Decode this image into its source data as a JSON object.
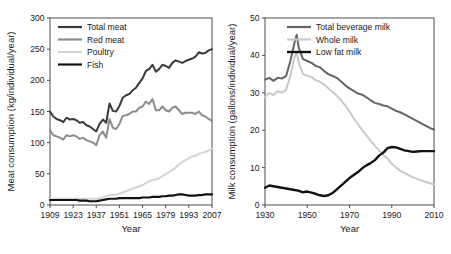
{
  "figure": {
    "background_color": "#ffffff",
    "frame_color": "#4d4d4d"
  },
  "chart_data": [
    {
      "id": "meat",
      "type": "line",
      "title": "",
      "xlabel": "Year",
      "ylabel": "Meat consumption (kg/individual/year)",
      "xlim": [
        1909,
        2007
      ],
      "ylim": [
        0,
        300
      ],
      "xticks": [
        1909,
        1923,
        1937,
        1951,
        1965,
        1979,
        1993,
        2007
      ],
      "yticks": [
        0,
        50,
        100,
        150,
        200,
        250,
        300
      ],
      "grid": false,
      "legend_position": "top-left",
      "series": [
        {
          "name": "Total meat",
          "color": "#3a3a3a",
          "width": 2.0,
          "x": [
            1909,
            1911,
            1913,
            1915,
            1917,
            1919,
            1921,
            1923,
            1925,
            1927,
            1929,
            1931,
            1933,
            1935,
            1937,
            1939,
            1941,
            1943,
            1945,
            1947,
            1949,
            1951,
            1953,
            1955,
            1957,
            1959,
            1961,
            1963,
            1965,
            1967,
            1969,
            1971,
            1973,
            1975,
            1977,
            1979,
            1981,
            1983,
            1985,
            1987,
            1989,
            1991,
            1993,
            1995,
            1997,
            1999,
            2001,
            2003,
            2005,
            2007
          ],
          "values": [
            150,
            142,
            138,
            136,
            133,
            140,
            137,
            138,
            136,
            132,
            133,
            128,
            126,
            122,
            118,
            130,
            137,
            132,
            163,
            151,
            150,
            159,
            172,
            176,
            178,
            184,
            188,
            196,
            203,
            215,
            218,
            225,
            214,
            218,
            225,
            223,
            220,
            228,
            232,
            230,
            228,
            231,
            233,
            235,
            238,
            245,
            243,
            244,
            248,
            250
          ]
        },
        {
          "name": "Red meat",
          "color": "#8c8c8c",
          "width": 2.0,
          "x": [
            1909,
            1911,
            1913,
            1915,
            1917,
            1919,
            1921,
            1923,
            1925,
            1927,
            1929,
            1931,
            1933,
            1935,
            1937,
            1939,
            1941,
            1943,
            1945,
            1947,
            1949,
            1951,
            1953,
            1955,
            1957,
            1959,
            1961,
            1963,
            1965,
            1967,
            1969,
            1971,
            1973,
            1975,
            1977,
            1979,
            1981,
            1983,
            1985,
            1987,
            1989,
            1991,
            1993,
            1995,
            1997,
            1999,
            2001,
            2003,
            2005,
            2007
          ],
          "values": [
            120,
            112,
            110,
            108,
            105,
            112,
            110,
            112,
            110,
            106,
            108,
            104,
            102,
            100,
            96,
            112,
            118,
            108,
            138,
            124,
            122,
            130,
            143,
            144,
            146,
            150,
            150,
            156,
            158,
            166,
            162,
            170,
            152,
            152,
            158,
            152,
            150,
            156,
            158,
            152,
            146,
            148,
            148,
            148,
            146,
            150,
            144,
            142,
            138,
            135
          ]
        },
        {
          "name": "Poultry",
          "color": "#d4d4d4",
          "width": 2.0,
          "x": [
            1909,
            1911,
            1913,
            1915,
            1917,
            1919,
            1921,
            1923,
            1925,
            1927,
            1929,
            1931,
            1933,
            1935,
            1937,
            1939,
            1941,
            1943,
            1945,
            1947,
            1949,
            1951,
            1953,
            1955,
            1957,
            1959,
            1961,
            1963,
            1965,
            1967,
            1969,
            1971,
            1973,
            1975,
            1977,
            1979,
            1981,
            1983,
            1985,
            1987,
            1989,
            1991,
            1993,
            1995,
            1997,
            1999,
            2001,
            2003,
            2005,
            2007
          ],
          "values": [
            10,
            10,
            10,
            10,
            10,
            10,
            10,
            10,
            10,
            10,
            10,
            10,
            10,
            10,
            10,
            11,
            12,
            14,
            16,
            16,
            17,
            18,
            20,
            22,
            24,
            26,
            28,
            30,
            32,
            35,
            38,
            40,
            41,
            43,
            46,
            50,
            53,
            56,
            60,
            65,
            69,
            72,
            75,
            78,
            79,
            82,
            84,
            85,
            88,
            90
          ]
        },
        {
          "name": "Fish",
          "color": "#111111",
          "width": 2.2,
          "x": [
            1909,
            1911,
            1913,
            1915,
            1917,
            1919,
            1921,
            1923,
            1925,
            1927,
            1929,
            1931,
            1933,
            1935,
            1937,
            1939,
            1941,
            1943,
            1945,
            1947,
            1949,
            1951,
            1953,
            1955,
            1957,
            1959,
            1961,
            1963,
            1965,
            1967,
            1969,
            1971,
            1973,
            1975,
            1977,
            1979,
            1981,
            1983,
            1985,
            1987,
            1989,
            1991,
            1993,
            1995,
            1997,
            1999,
            2001,
            2003,
            2005,
            2007
          ],
          "values": [
            8,
            8,
            8,
            8,
            8,
            8,
            8,
            8,
            8,
            7,
            7,
            7,
            6,
            6,
            6,
            7,
            8,
            9,
            10,
            10,
            10,
            11,
            11,
            11,
            11,
            11,
            11,
            11,
            12,
            12,
            12,
            13,
            13,
            13,
            14,
            14,
            15,
            15,
            16,
            17,
            17,
            16,
            15,
            15,
            15,
            16,
            16,
            17,
            17,
            17
          ]
        }
      ]
    },
    {
      "id": "milk",
      "type": "line",
      "title": "",
      "xlabel": "Year",
      "ylabel": "Milk consumption (gallons/individual/year)",
      "xlim": [
        1930,
        2010
      ],
      "ylim": [
        0,
        50
      ],
      "xticks": [
        1930,
        1950,
        1970,
        1990,
        2010
      ],
      "yticks": [
        0,
        10,
        20,
        30,
        40,
        50
      ],
      "grid": false,
      "legend_position": "top-right",
      "series": [
        {
          "name": "Total beverage milk",
          "color": "#666666",
          "width": 2.0,
          "x": [
            1930,
            1932,
            1934,
            1936,
            1938,
            1940,
            1942,
            1944,
            1945,
            1946,
            1948,
            1950,
            1952,
            1954,
            1956,
            1958,
            1960,
            1962,
            1964,
            1966,
            1968,
            1970,
            1972,
            1974,
            1976,
            1978,
            1980,
            1982,
            1984,
            1986,
            1988,
            1990,
            1992,
            1994,
            1996,
            1998,
            2000,
            2002,
            2004,
            2006,
            2008,
            2010
          ],
          "values": [
            33.5,
            34.0,
            33.2,
            34.0,
            33.8,
            34.5,
            38.5,
            43.5,
            45.5,
            42.0,
            39.0,
            38.5,
            38.0,
            37.2,
            36.8,
            35.8,
            35.0,
            34.5,
            34.0,
            33.0,
            32.0,
            31.2,
            30.5,
            29.8,
            29.5,
            28.8,
            28.0,
            27.3,
            27.0,
            26.6,
            26.4,
            25.8,
            25.2,
            24.8,
            24.2,
            23.6,
            23.0,
            22.4,
            21.8,
            21.2,
            20.6,
            20.2
          ]
        },
        {
          "name": "Whole milk",
          "color": "#c9c9c9",
          "width": 2.0,
          "x": [
            1930,
            1932,
            1934,
            1936,
            1938,
            1940,
            1942,
            1944,
            1945,
            1946,
            1948,
            1950,
            1952,
            1954,
            1956,
            1958,
            1960,
            1962,
            1964,
            1966,
            1968,
            1970,
            1972,
            1974,
            1976,
            1978,
            1980,
            1982,
            1984,
            1986,
            1988,
            1990,
            1992,
            1994,
            1996,
            1998,
            2000,
            2002,
            2004,
            2006,
            2008,
            2010
          ],
          "values": [
            28.8,
            30.0,
            29.4,
            30.4,
            30.0,
            30.8,
            34.5,
            39.5,
            41.0,
            38.0,
            35.0,
            34.6,
            34.2,
            33.4,
            33.0,
            32.2,
            31.2,
            30.2,
            29.2,
            28.0,
            26.6,
            25.0,
            23.2,
            21.6,
            20.0,
            18.6,
            17.2,
            15.8,
            14.6,
            13.4,
            12.4,
            11.0,
            10.0,
            9.2,
            8.6,
            8.0,
            7.4,
            7.0,
            6.6,
            6.2,
            5.8,
            5.5
          ]
        },
        {
          "name": "Low fat milk",
          "color": "#111111",
          "width": 2.4,
          "x": [
            1930,
            1932,
            1934,
            1936,
            1938,
            1940,
            1942,
            1944,
            1945,
            1946,
            1948,
            1950,
            1952,
            1954,
            1956,
            1958,
            1960,
            1962,
            1964,
            1966,
            1968,
            1970,
            1972,
            1974,
            1976,
            1978,
            1980,
            1982,
            1984,
            1986,
            1988,
            1990,
            1992,
            1994,
            1996,
            1998,
            2000,
            2002,
            2004,
            2006,
            2008,
            2010
          ],
          "values": [
            4.6,
            5.2,
            5.0,
            4.8,
            4.6,
            4.4,
            4.2,
            4.0,
            3.9,
            3.8,
            3.4,
            3.6,
            3.3,
            3.0,
            2.6,
            2.4,
            2.6,
            3.2,
            4.2,
            5.2,
            6.2,
            7.2,
            8.0,
            8.8,
            9.8,
            10.6,
            11.2,
            12.0,
            13.2,
            14.0,
            15.2,
            15.5,
            15.4,
            15.0,
            14.6,
            14.4,
            14.2,
            14.3,
            14.4,
            14.4,
            14.4,
            14.4
          ]
        }
      ]
    }
  ]
}
